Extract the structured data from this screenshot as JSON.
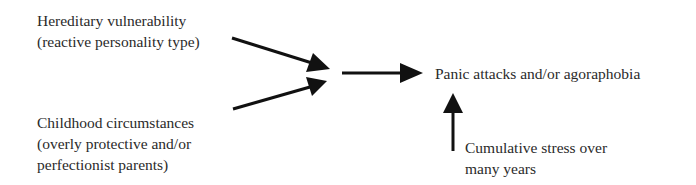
{
  "diagram": {
    "causes": [
      {
        "id": "hereditary",
        "lines": [
          "Hereditary vulnerability",
          "(reactive personality type)"
        ]
      },
      {
        "id": "childhood",
        "lines": [
          "Childhood circumstances",
          "(overly protective and/or",
          "perfectionist parents)"
        ]
      }
    ],
    "outcome": {
      "label": "Panic attacks and/or agoraphobia"
    },
    "trigger": {
      "lines": [
        "Cumulative stress over",
        "many years"
      ]
    },
    "arrows": [
      {
        "from": "hereditary",
        "to": "junction"
      },
      {
        "from": "childhood",
        "to": "junction"
      },
      {
        "from": "junction",
        "to": "outcome"
      },
      {
        "from": "trigger",
        "to": "outcome"
      }
    ],
    "arrow_color": "#111111",
    "text_color": "#2a2a2a"
  }
}
